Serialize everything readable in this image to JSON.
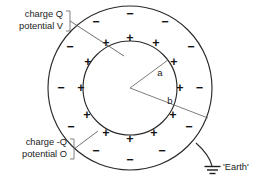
{
  "diagram": {
    "background_color": "#ffffff",
    "line_color": "#2a2a2a",
    "text_color": "#1b1b1b",
    "labels": {
      "inner_charge": "charge Q",
      "inner_potential": "potential V",
      "outer_charge": "charge -Q",
      "outer_potential": "potential O",
      "inner_radius": "a",
      "outer_radius": "b",
      "earth": "'Earth'"
    },
    "geometry": {
      "center_x": 130,
      "center_y": 88,
      "inner_radius_px": 47,
      "outer_radius_px": 82
    },
    "charge_signs": {
      "inner_symbol": "+",
      "outer_symbol": "−",
      "inner_count": 12,
      "outer_count": 12,
      "inner_positions_deg": [
        90,
        60,
        30,
        0,
        330,
        300,
        270,
        240,
        210,
        180,
        150,
        120
      ],
      "outer_positions_deg": [
        90,
        60,
        30,
        0,
        330,
        300,
        270,
        240,
        210,
        180,
        150,
        120
      ]
    }
  }
}
